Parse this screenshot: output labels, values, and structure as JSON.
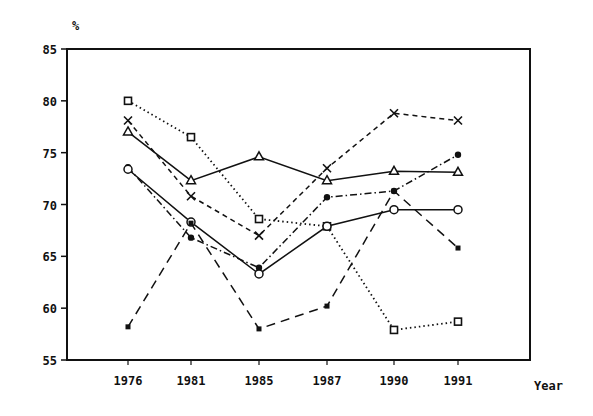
{
  "chart_data": {
    "type": "line",
    "title": "",
    "xlabel": "Year",
    "ylabel": "%",
    "ylim": [
      55,
      85
    ],
    "yticks": [
      55,
      60,
      65,
      70,
      75,
      80,
      85
    ],
    "grid": false,
    "legend": null,
    "categories": [
      "1976",
      "1981",
      "1985",
      "1987",
      "1990",
      "1991"
    ],
    "series": [
      {
        "name": "open-square-dotted",
        "marker": "open-square",
        "line": "dotted",
        "values": [
          80.0,
          76.5,
          68.6,
          67.9,
          57.9,
          58.7
        ]
      },
      {
        "name": "cross-dashed",
        "marker": "x",
        "line": "dashed",
        "values": [
          78.1,
          70.8,
          67.0,
          73.5,
          78.8,
          78.1
        ]
      },
      {
        "name": "triangle-solid",
        "marker": "open-triangle",
        "line": "solid",
        "values": [
          77.0,
          72.3,
          74.6,
          72.3,
          73.2,
          73.1
        ]
      },
      {
        "name": "filled-circle-dashdot",
        "marker": "filled-circle",
        "line": "dash-dot",
        "values": [
          73.6,
          66.8,
          63.9,
          70.7,
          71.3,
          74.8
        ]
      },
      {
        "name": "open-circle-solid",
        "marker": "open-circle",
        "line": "solid",
        "values": [
          73.4,
          68.3,
          63.3,
          67.9,
          69.5,
          69.5
        ]
      },
      {
        "name": "star-longdash",
        "marker": "small-filled-square",
        "line": "long-dash",
        "values": [
          58.2,
          68.2,
          58.0,
          60.2,
          71.3,
          65.8
        ]
      }
    ]
  },
  "labels": {
    "y_unit": "%",
    "x_axis": "Year"
  }
}
